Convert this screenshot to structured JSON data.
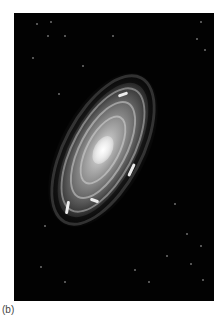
{
  "figure": {
    "label": "(b)",
    "background_color": "#020202",
    "page_color": "#ffffff"
  }
}
